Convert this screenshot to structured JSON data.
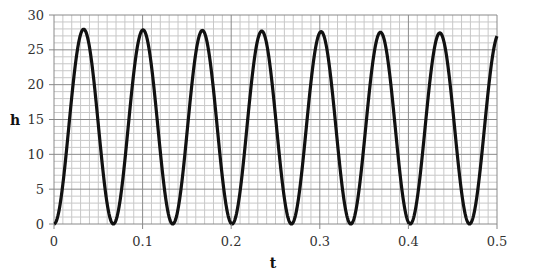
{
  "chart_data": {
    "type": "line",
    "title": "",
    "xlabel": "t",
    "ylabel": "h",
    "xlim": [
      0,
      0.5
    ],
    "ylim": [
      0,
      30
    ],
    "x_ticks": [
      "0",
      "0.1",
      "0.2",
      "0.3",
      "0.4",
      "0.5"
    ],
    "y_ticks": [
      "0",
      "5",
      "10",
      "15",
      "20",
      "25",
      "30"
    ],
    "grid": {
      "major_x": 0.1,
      "minor_x": 0.01,
      "major_y": 5,
      "minor_y": 1
    },
    "legend": null,
    "series": [
      {
        "name": "h(t)",
        "color": "#111111",
        "description": "periodic oscillation, period ~0.067, min 0, peaks ~28 decaying slightly to ~27.4",
        "peaks": [
          {
            "t": 0.034,
            "h": 28.0
          },
          {
            "t": 0.101,
            "h": 27.9
          },
          {
            "t": 0.168,
            "h": 27.8
          },
          {
            "t": 0.235,
            "h": 27.7
          },
          {
            "t": 0.302,
            "h": 27.6
          },
          {
            "t": 0.369,
            "h": 27.5
          },
          {
            "t": 0.436,
            "h": 27.4
          }
        ],
        "troughs": [
          {
            "t": 0.0,
            "h": 0
          },
          {
            "t": 0.067,
            "h": 0
          },
          {
            "t": 0.134,
            "h": 0
          },
          {
            "t": 0.201,
            "h": 0
          },
          {
            "t": 0.268,
            "h": 0
          },
          {
            "t": 0.335,
            "h": 0
          },
          {
            "t": 0.402,
            "h": 0
          },
          {
            "t": 0.469,
            "h": 0
          }
        ],
        "end_point": {
          "t": 0.5,
          "h": 27.4
        }
      }
    ]
  },
  "colors": {
    "curve": "#111111",
    "major_grid": "#8a8a8a",
    "minor_grid": "#c8c8c8",
    "axis": "#888888"
  }
}
